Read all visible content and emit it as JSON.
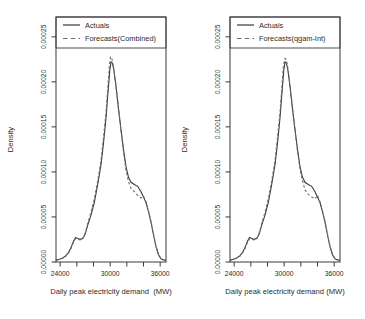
{
  "figure": {
    "background": "#ffffff",
    "text_color": "#2b2b2b",
    "axis_color": "#3a3a3a"
  },
  "chart_data": [
    {
      "type": "line",
      "title": "",
      "xlabel": "Daily peak electricity demand  (MW)",
      "ylabel": "Density",
      "xlim": [
        23500,
        36700
      ],
      "ylim": [
        0,
        0.000272
      ],
      "grid": false,
      "legend_position": "top",
      "xticks": {
        "values": [
          24000,
          26000,
          28000,
          30000,
          32000,
          34000,
          36000
        ],
        "labels": [
          "24000",
          "",
          "",
          "30000",
          "",
          "",
          "36000"
        ]
      },
      "yticks": {
        "values": [
          0,
          5e-05,
          0.0001,
          0.00015,
          0.0002,
          0.00025
        ],
        "labels": [
          "0.00000",
          "0.00005",
          "0.00010",
          "0.00015",
          "0.00020",
          "0.00025"
        ]
      },
      "series": [
        {
          "name": "Actuals",
          "style": "solid",
          "color": "#3a3a3a",
          "points": [
            [
              23500,
              2.2e-06
            ],
            [
              23900,
              3e-06
            ],
            [
              24300,
              4.5e-06
            ],
            [
              24700,
              7e-06
            ],
            [
              25000,
              1.05e-05
            ],
            [
              25300,
              1.6e-05
            ],
            [
              25600,
              2.3e-05
            ],
            [
              25850,
              2.72e-05
            ],
            [
              26100,
              2.62e-05
            ],
            [
              26400,
              2.52e-05
            ],
            [
              26700,
              2.6e-05
            ],
            [
              27000,
              3.1e-05
            ],
            [
              27300,
              4.1e-05
            ],
            [
              27700,
              5.2e-05
            ],
            [
              28100,
              6.6e-05
            ],
            [
              28500,
              8.6e-05
            ],
            [
              28900,
              0.000108
            ],
            [
              29200,
              0.000132
            ],
            [
              29500,
              0.00016
            ],
            [
              29750,
              0.00019
            ],
            [
              29950,
              0.000213
            ],
            [
              30100,
              0.000222
            ],
            [
              30250,
              0.000221
            ],
            [
              30450,
              0.000213
            ],
            [
              30700,
              0.000195
            ],
            [
              31000,
              0.00017
            ],
            [
              31300,
              0.000147
            ],
            [
              31600,
              0.000125
            ],
            [
              31900,
              0.000106
            ],
            [
              32200,
              9.4e-05
            ],
            [
              32500,
              8.85e-05
            ],
            [
              32900,
              8.6e-05
            ],
            [
              33300,
              8.4e-05
            ],
            [
              33700,
              7.8e-05
            ],
            [
              34000,
              7.2e-05
            ],
            [
              34300,
              6.6e-05
            ],
            [
              34600,
              5.6e-05
            ],
            [
              34900,
              4.4e-05
            ],
            [
              35200,
              3e-05
            ],
            [
              35500,
              1.7e-05
            ],
            [
              35800,
              8e-06
            ],
            [
              36100,
              3.5e-06
            ],
            [
              36400,
              2.2e-06
            ],
            [
              36700,
              2e-06
            ]
          ]
        },
        {
          "name": "Forecasts(Combined)",
          "style": "dashed",
          "color": "#6e6e6e",
          "points": [
            [
              23500,
              2e-06
            ],
            [
              23900,
              2.8e-06
            ],
            [
              24300,
              4.2e-06
            ],
            [
              24700,
              6.6e-06
            ],
            [
              25000,
              1e-05
            ],
            [
              25300,
              1.5e-05
            ],
            [
              25600,
              2.2e-05
            ],
            [
              25850,
              2.6e-05
            ],
            [
              26100,
              2.5e-05
            ],
            [
              26400,
              2.45e-05
            ],
            [
              26700,
              2.6e-05
            ],
            [
              27000,
              3.2e-05
            ],
            [
              27300,
              4.3e-05
            ],
            [
              27700,
              5.5e-05
            ],
            [
              28100,
              7e-05
            ],
            [
              28500,
              9e-05
            ],
            [
              28900,
              0.000113
            ],
            [
              29200,
              0.000138
            ],
            [
              29500,
              0.000166
            ],
            [
              29700,
              0.000192
            ],
            [
              29900,
              0.000218
            ],
            [
              30050,
              0.000228
            ],
            [
              30200,
              0.000226
            ],
            [
              30400,
              0.000216
            ],
            [
              30700,
              0.000196
            ],
            [
              31000,
              0.000171
            ],
            [
              31300,
              0.000146
            ],
            [
              31600,
              0.000122
            ],
            [
              31900,
              0.000102
            ],
            [
              32200,
              8.9e-05
            ],
            [
              32500,
              8.2e-05
            ],
            [
              32900,
              7.8e-05
            ],
            [
              33300,
              7.4e-05
            ],
            [
              33700,
              7.1e-05
            ],
            [
              34000,
              7.3e-05
            ],
            [
              34300,
              6.7e-05
            ],
            [
              34600,
              5.7e-05
            ],
            [
              34900,
              4.5e-05
            ],
            [
              35200,
              3.1e-05
            ],
            [
              35500,
              1.8e-05
            ],
            [
              35800,
              8.5e-06
            ],
            [
              36100,
              3.8e-06
            ],
            [
              36400,
              2.4e-06
            ],
            [
              36700,
              2e-06
            ]
          ]
        }
      ]
    },
    {
      "type": "line",
      "title": "",
      "xlabel": "Daily peak electricity demand (MW)",
      "ylabel": "Density",
      "xlim": [
        23500,
        36700
      ],
      "ylim": [
        0,
        0.000272
      ],
      "grid": false,
      "legend_position": "top",
      "xticks": {
        "values": [
          24000,
          26000,
          28000,
          30000,
          32000,
          34000,
          36000
        ],
        "labels": [
          "24000",
          "",
          "",
          "30000",
          "",
          "",
          "36000"
        ]
      },
      "yticks": {
        "values": [
          0,
          5e-05,
          0.0001,
          0.00015,
          0.0002,
          0.00025
        ],
        "labels": [
          "0.00000",
          "0.00005",
          "0.00010",
          "0.00015",
          "0.00020",
          "0.00025"
        ]
      },
      "series": [
        {
          "name": "Actuals",
          "style": "solid",
          "color": "#3a3a3a",
          "points": [
            [
              23500,
              2.2e-06
            ],
            [
              23900,
              3e-06
            ],
            [
              24300,
              4.5e-06
            ],
            [
              24700,
              7e-06
            ],
            [
              25000,
              1.05e-05
            ],
            [
              25300,
              1.6e-05
            ],
            [
              25600,
              2.3e-05
            ],
            [
              25850,
              2.72e-05
            ],
            [
              26100,
              2.62e-05
            ],
            [
              26400,
              2.52e-05
            ],
            [
              26700,
              2.6e-05
            ],
            [
              27000,
              3.1e-05
            ],
            [
              27300,
              4.1e-05
            ],
            [
              27700,
              5.2e-05
            ],
            [
              28100,
              6.6e-05
            ],
            [
              28500,
              8.6e-05
            ],
            [
              28900,
              0.000108
            ],
            [
              29200,
              0.000132
            ],
            [
              29500,
              0.00016
            ],
            [
              29750,
              0.00019
            ],
            [
              29950,
              0.000213
            ],
            [
              30100,
              0.000222
            ],
            [
              30250,
              0.000221
            ],
            [
              30450,
              0.000213
            ],
            [
              30700,
              0.000195
            ],
            [
              31000,
              0.00017
            ],
            [
              31300,
              0.000147
            ],
            [
              31600,
              0.000125
            ],
            [
              31900,
              0.000106
            ],
            [
              32200,
              9.4e-05
            ],
            [
              32500,
              8.85e-05
            ],
            [
              32900,
              8.6e-05
            ],
            [
              33300,
              8.4e-05
            ],
            [
              33700,
              7.8e-05
            ],
            [
              34000,
              7.2e-05
            ],
            [
              34300,
              6.6e-05
            ],
            [
              34600,
              5.6e-05
            ],
            [
              34900,
              4.4e-05
            ],
            [
              35200,
              3e-05
            ],
            [
              35500,
              1.7e-05
            ],
            [
              35800,
              8e-06
            ],
            [
              36100,
              3.5e-06
            ],
            [
              36400,
              2.2e-06
            ],
            [
              36700,
              2e-06
            ]
          ]
        },
        {
          "name": "Forecasts(qgam-Int)",
          "style": "dashed",
          "color": "#6e6e6e",
          "points": [
            [
              23500,
              2e-06
            ],
            [
              23900,
              2.8e-06
            ],
            [
              24300,
              4.2e-06
            ],
            [
              24700,
              6.6e-06
            ],
            [
              25000,
              1e-05
            ],
            [
              25300,
              1.5e-05
            ],
            [
              25600,
              2.2e-05
            ],
            [
              25850,
              2.6e-05
            ],
            [
              26100,
              2.5e-05
            ],
            [
              26400,
              2.45e-05
            ],
            [
              26700,
              2.6e-05
            ],
            [
              27000,
              3.2e-05
            ],
            [
              27300,
              4.3e-05
            ],
            [
              27700,
              5.5e-05
            ],
            [
              28100,
              7e-05
            ],
            [
              28500,
              9e-05
            ],
            [
              28900,
              0.000113
            ],
            [
              29200,
              0.000138
            ],
            [
              29500,
              0.000166
            ],
            [
              29700,
              0.000192
            ],
            [
              29900,
              0.000217
            ],
            [
              30100,
              0.000226
            ],
            [
              30250,
              0.000225
            ],
            [
              30450,
              0.000215
            ],
            [
              30700,
              0.000196
            ],
            [
              31000,
              0.000171
            ],
            [
              31300,
              0.000146
            ],
            [
              31600,
              0.000123
            ],
            [
              31900,
              0.000103
            ],
            [
              32200,
              9e-05
            ],
            [
              32500,
              8e-05
            ],
            [
              32900,
              7.5e-05
            ],
            [
              33300,
              7.2e-05
            ],
            [
              33700,
              7e-05
            ],
            [
              34000,
              7.4e-05
            ],
            [
              34300,
              6.7e-05
            ],
            [
              34600,
              5.7e-05
            ],
            [
              34900,
              4.5e-05
            ],
            [
              35200,
              3.1e-05
            ],
            [
              35500,
              1.8e-05
            ],
            [
              35800,
              8.5e-06
            ],
            [
              36100,
              3.8e-06
            ],
            [
              36400,
              2.4e-06
            ],
            [
              36700,
              2e-06
            ]
          ]
        }
      ]
    }
  ]
}
